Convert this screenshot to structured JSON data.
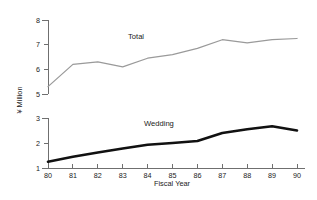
{
  "chart_data": {
    "type": "line",
    "title": "",
    "xlabel": "Fiscal Year",
    "ylabel": "¥ Million",
    "x": [
      80,
      81,
      82,
      83,
      84,
      85,
      86,
      87,
      88,
      89,
      90
    ],
    "xtick_labels": [
      "80",
      "81",
      "82",
      "83",
      "84",
      "85",
      "86",
      "87",
      "88",
      "89",
      "90"
    ],
    "broken_axis": true,
    "upper_axis": {
      "ylim": [
        5,
        8
      ],
      "ticks": [
        5,
        6,
        7,
        8
      ],
      "tick_labels": [
        "5",
        "6",
        "7",
        "8"
      ]
    },
    "lower_axis": {
      "ylim": [
        1,
        3
      ],
      "ticks": [
        1,
        2,
        3
      ],
      "tick_labels": [
        "1",
        "2",
        "3"
      ]
    },
    "grid": false,
    "legend_position": "inline-annotations",
    "series": [
      {
        "name": "Total",
        "axis": "upper",
        "color": "#9a9a9a",
        "label_text": "Total",
        "values": [
          5.3,
          6.2,
          6.3,
          6.1,
          6.45,
          6.6,
          6.85,
          7.2,
          7.07,
          7.2,
          7.25
        ]
      },
      {
        "name": "Wedding",
        "axis": "lower",
        "color": "#111111",
        "label_text": "Wedding",
        "values": [
          1.25,
          1.45,
          1.62,
          1.78,
          1.93,
          2.0,
          2.08,
          2.4,
          2.55,
          2.67,
          2.5
        ]
      }
    ]
  }
}
